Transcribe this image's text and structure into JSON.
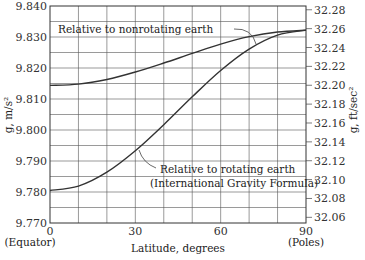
{
  "chart_data": {
    "type": "line",
    "title": "",
    "xlabel": "Latitude, degrees",
    "ylabel": "g, m/s²",
    "ylabel_right": "g, ft/sec²",
    "xlim": [
      0,
      90
    ],
    "ylim": [
      9.77,
      9.84
    ],
    "ylim_right_ftps2": [
      32.054,
      32.284
    ],
    "grid": true,
    "x_ticks": [
      0,
      30,
      60,
      90
    ],
    "x_tick_sublabels": {
      "0": "(Equator)",
      "90": "(Poles)"
    },
    "y_ticks": [
      "9.770",
      "9.780",
      "9.790",
      "9.800",
      "9.810",
      "9.820",
      "9.830",
      "9.840"
    ],
    "y_ticks_right": [
      "32.06",
      "32.08",
      "32.10",
      "32.12",
      "32.14",
      "32.16",
      "32.18",
      "32.20",
      "32.22",
      "32.24",
      "32.26",
      "32.28"
    ],
    "x": [
      0,
      10,
      20,
      30,
      40,
      50,
      60,
      70,
      80,
      90
    ],
    "series": [
      {
        "name": "Relative to nonrotating earth",
        "values": [
          9.8144,
          9.8148,
          9.8163,
          9.8187,
          9.8216,
          9.8247,
          9.8277,
          9.8301,
          9.8316,
          9.8322
        ]
      },
      {
        "name": "Relative to rotating earth (International Gravity Formula)",
        "values": [
          9.7805,
          9.7819,
          9.7864,
          9.7933,
          9.8017,
          9.8107,
          9.8192,
          9.8261,
          9.8306,
          9.8322
        ]
      }
    ],
    "annotations": [
      {
        "text": "Relative to nonrotating earth",
        "series": 0
      },
      {
        "text_line1": "Relative to rotating earth",
        "text_line2": "(International Gravity Formula)",
        "series": 1
      }
    ],
    "legend": "none (curves annotated inline)"
  },
  "labels": {
    "xlabel": "Latitude, degrees",
    "ylabel_left": "g, m/s²",
    "ylabel_right": "g, ft/sec²",
    "equator": "(Equator)",
    "poles": "(Poles)",
    "ann_nonrot": "Relative to nonrotating earth",
    "ann_rot_1": "Relative to rotating earth",
    "ann_rot_2": "(International Gravity Formula)"
  }
}
